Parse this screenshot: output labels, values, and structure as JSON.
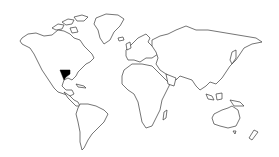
{
  "map": {
    "type": "world-outline",
    "background": "#ffffff",
    "outline_color": "#3a3a3a",
    "highlight": {
      "region": "Texas, United States",
      "color": "#000000",
      "marker_icon": "filled-region"
    },
    "continents": [
      "North America",
      "Greenland",
      "South America",
      "Europe",
      "Africa",
      "Asia",
      "Australia",
      "New Zealand"
    ]
  }
}
